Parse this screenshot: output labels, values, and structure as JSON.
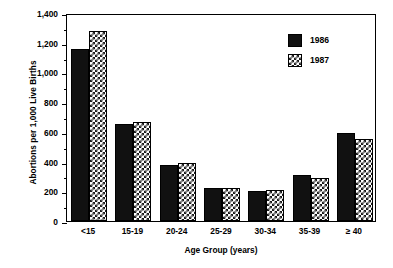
{
  "chart_data": {
    "type": "bar",
    "title": "",
    "xlabel": "Age Group (years)",
    "ylabel": "Abortions per 1,000 Live Births",
    "categories": [
      "<15",
      "15-19",
      "20-24",
      "25-29",
      "30-34",
      "35-39",
      "≥ 40"
    ],
    "series": [
      {
        "name": "1986",
        "values": [
          1160,
          650,
          380,
          220,
          200,
          310,
          590
        ]
      },
      {
        "name": "1987",
        "values": [
          1280,
          665,
          388,
          220,
          210,
          290,
          550
        ]
      }
    ],
    "ylim": [
      0,
      1400
    ],
    "ytick_labels": [
      "0",
      "200",
      "400",
      "600",
      "800",
      "1,000",
      "1,200",
      "1,400"
    ],
    "ytick_values": [
      0,
      200,
      400,
      600,
      800,
      1000,
      1200,
      1400
    ],
    "yminor_step": 100,
    "grid": false,
    "legend_position": "top-right",
    "legend": [
      "1986",
      "1987"
    ],
    "colors": {
      "series_1986": "#111111",
      "series_1987": "#ffffff",
      "axis": "#000000"
    }
  }
}
